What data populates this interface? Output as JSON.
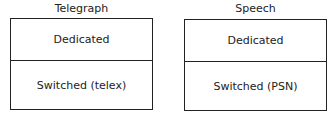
{
  "diagram": {
    "panels": [
      {
        "title": "Telegraph",
        "rows": [
          "Dedicated",
          "Switched (telex)"
        ]
      },
      {
        "title": "Speech",
        "rows": [
          "Dedicated",
          "Switched (PSN)"
        ]
      }
    ]
  }
}
